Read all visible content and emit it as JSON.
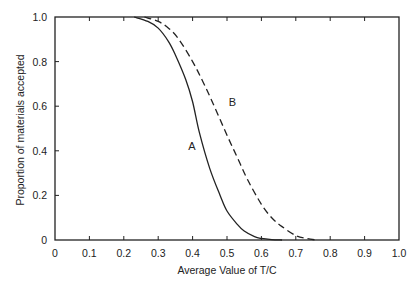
{
  "chart_data": {
    "type": "line",
    "title": "",
    "xlabel": "Average Value of T/C",
    "ylabel": "Proportion of materials accepted",
    "xlim": [
      0,
      1.0
    ],
    "ylim": [
      0,
      1.0
    ],
    "grid": false,
    "legend": "none (curves labelled inline as A and B)",
    "x_ticks": [
      "0",
      "0.1",
      "0.2",
      "0.3",
      "0.4",
      "0.5",
      "0.6",
      "0.7",
      "0.8",
      "0.9",
      "1.0"
    ],
    "y_ticks": [
      "0",
      "0.2",
      "0.4",
      "0.6",
      "0.8",
      "1.0"
    ],
    "series": [
      {
        "name": "A",
        "style": "solid",
        "x": [
          0.23,
          0.27,
          0.3,
          0.33,
          0.35,
          0.38,
          0.4,
          0.42,
          0.45,
          0.48,
          0.5,
          0.53,
          0.55,
          0.58,
          0.6,
          0.63,
          0.66
        ],
        "y": [
          1.0,
          0.98,
          0.95,
          0.89,
          0.83,
          0.72,
          0.62,
          0.48,
          0.32,
          0.2,
          0.13,
          0.07,
          0.04,
          0.015,
          0.007,
          0.002,
          0.0
        ],
        "label_position": [
          0.41,
          0.42
        ]
      },
      {
        "name": "B",
        "style": "dashed",
        "x": [
          0.26,
          0.3,
          0.33,
          0.36,
          0.4,
          0.43,
          0.46,
          0.5,
          0.53,
          0.56,
          0.6,
          0.63,
          0.66,
          0.7,
          0.73,
          0.76
        ],
        "y": [
          1.0,
          0.98,
          0.95,
          0.9,
          0.8,
          0.71,
          0.61,
          0.47,
          0.37,
          0.27,
          0.16,
          0.1,
          0.06,
          0.02,
          0.007,
          0.0
        ],
        "label_position": [
          0.51,
          0.62
        ]
      }
    ]
  },
  "labels": {
    "xlabel": "Average Value of T/C",
    "ylabel": "Proportion of materials accepted",
    "curve_a": "A",
    "curve_b": "B"
  }
}
